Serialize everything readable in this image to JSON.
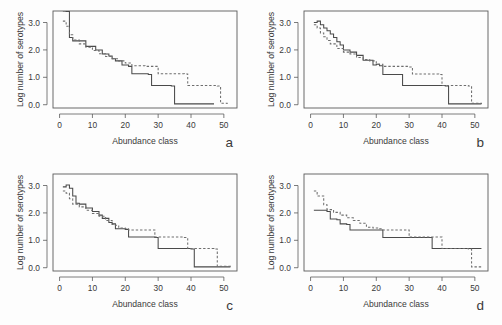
{
  "figure": {
    "title": "",
    "panel_letters": [
      "a",
      "b",
      "c",
      "d"
    ],
    "colors": {
      "solid_line": "#4a4a4a",
      "dashed_line": "#6e6e6e",
      "axis": "#5a5a5a",
      "background": "#fdfdfd",
      "text": "#3a3a3a"
    }
  },
  "chart_data": [
    {
      "type": "line",
      "panel": "a",
      "title": "",
      "xlabel": "Abundance class",
      "ylabel": "Log number of serotypes",
      "xlim": [
        -2,
        54
      ],
      "ylim": [
        -0.12,
        3.42
      ],
      "xticks": [
        0,
        10,
        20,
        30,
        40,
        50
      ],
      "xticklabels": [
        "0",
        "10",
        "20",
        "30",
        "40",
        "50"
      ],
      "yticks": [
        0.0,
        1.0,
        2.0,
        3.0
      ],
      "yticklabels": [
        "0.0",
        "1.0",
        "2.0",
        "3.0"
      ],
      "grid": false,
      "legend": "none",
      "drawstyle": "steps-post",
      "series": [
        {
          "name": "observed",
          "style": "solid",
          "x": [
            1,
            2,
            3,
            4,
            7,
            8,
            11,
            13,
            15,
            16,
            17,
            19,
            21,
            22,
            27,
            28,
            34,
            35,
            47
          ],
          "y": [
            3.42,
            3.4,
            2.45,
            2.33,
            2.33,
            2.13,
            2.0,
            1.85,
            1.78,
            1.68,
            1.6,
            1.45,
            1.4,
            1.13,
            1.1,
            0.7,
            0.68,
            0.03,
            0.03
          ]
        },
        {
          "name": "expected",
          "style": "dashed",
          "x": [
            1,
            2,
            3,
            4,
            6,
            8,
            10,
            12,
            14,
            16,
            18,
            20,
            22,
            26,
            29,
            30,
            38,
            39,
            48,
            49,
            51
          ],
          "y": [
            3.05,
            2.86,
            2.55,
            2.36,
            2.22,
            2.1,
            1.98,
            1.86,
            1.76,
            1.68,
            1.6,
            1.52,
            1.42,
            1.4,
            1.4,
            1.13,
            1.12,
            0.7,
            0.68,
            0.05,
            0.03
          ]
        }
      ]
    },
    {
      "type": "line",
      "panel": "b",
      "title": "",
      "xlabel": "Abundance class",
      "ylabel": "Log number of serotypes",
      "xlim": [
        -2,
        54
      ],
      "ylim": [
        -0.12,
        3.42
      ],
      "xticks": [
        0,
        10,
        20,
        30,
        40,
        50
      ],
      "xticklabels": [
        "0",
        "10",
        "20",
        "30",
        "40",
        "50"
      ],
      "yticks": [
        0.0,
        1.0,
        2.0,
        3.0
      ],
      "yticklabels": [
        "0.0",
        "1.0",
        "2.0",
        "3.0"
      ],
      "grid": false,
      "legend": "none",
      "drawstyle": "steps-post",
      "series": [
        {
          "name": "observed",
          "style": "solid",
          "x": [
            1,
            2,
            3,
            4,
            5,
            6,
            7,
            8,
            9,
            10,
            12,
            14,
            16,
            18,
            19,
            20,
            21,
            22,
            27,
            28,
            41,
            42,
            52
          ],
          "y": [
            3.0,
            3.05,
            2.92,
            2.8,
            2.7,
            2.58,
            2.45,
            2.3,
            2.18,
            2.0,
            1.92,
            1.8,
            1.62,
            1.62,
            1.45,
            1.48,
            1.42,
            1.1,
            1.1,
            0.7,
            0.68,
            0.03,
            0.03
          ]
        },
        {
          "name": "expected",
          "style": "dashed",
          "x": [
            1,
            2,
            3,
            4,
            5,
            6,
            8,
            10,
            12,
            14,
            16,
            18,
            20,
            22,
            24,
            28,
            30,
            31,
            39,
            40,
            48,
            49,
            52
          ],
          "y": [
            2.92,
            2.8,
            2.62,
            2.48,
            2.34,
            2.22,
            2.05,
            1.92,
            1.85,
            1.72,
            1.65,
            1.6,
            1.48,
            1.4,
            1.4,
            1.4,
            1.38,
            1.12,
            1.1,
            0.7,
            0.68,
            0.05,
            0.03
          ]
        }
      ]
    },
    {
      "type": "line",
      "panel": "c",
      "title": "",
      "xlabel": "Abundance class",
      "ylabel": "Log number of serotypes",
      "xlim": [
        -2,
        54
      ],
      "ylim": [
        -0.12,
        3.42
      ],
      "xticks": [
        0,
        10,
        20,
        30,
        40,
        50
      ],
      "xticklabels": [
        "0",
        "10",
        "20",
        "30",
        "40",
        "50"
      ],
      "yticks": [
        0.0,
        1.0,
        2.0,
        3.0
      ],
      "yticklabels": [
        "0.0",
        "1.0",
        "2.0",
        "3.0"
      ],
      "grid": false,
      "legend": "none",
      "drawstyle": "steps-post",
      "series": [
        {
          "name": "observed",
          "style": "solid",
          "x": [
            1,
            2,
            3,
            4,
            5,
            6,
            8,
            10,
            12,
            13,
            15,
            16,
            17,
            20,
            21,
            29,
            30,
            40,
            41,
            52
          ],
          "y": [
            2.95,
            3.02,
            2.9,
            2.62,
            2.35,
            2.32,
            2.18,
            2.05,
            1.92,
            1.8,
            1.65,
            1.6,
            1.42,
            1.4,
            1.12,
            1.1,
            0.7,
            0.68,
            0.03,
            0.03
          ]
        },
        {
          "name": "expected",
          "style": "dashed",
          "x": [
            1,
            2,
            3,
            4,
            6,
            8,
            10,
            12,
            14,
            16,
            17,
            18,
            20,
            21,
            28,
            29,
            38,
            39,
            47,
            48,
            52
          ],
          "y": [
            2.8,
            2.72,
            2.52,
            2.32,
            2.22,
            2.1,
            1.98,
            1.88,
            1.72,
            1.58,
            1.55,
            1.45,
            1.42,
            1.38,
            1.38,
            1.12,
            1.1,
            0.7,
            0.68,
            0.05,
            0.03
          ]
        }
      ]
    },
    {
      "type": "line",
      "panel": "d",
      "title": "",
      "xlabel": "Abundance class",
      "ylabel": "Log number of serotypes",
      "xlim": [
        -2,
        54
      ],
      "ylim": [
        -0.12,
        3.42
      ],
      "xticks": [
        0,
        10,
        20,
        30,
        40,
        50
      ],
      "xticklabels": [
        "0",
        "10",
        "20",
        "30",
        "40",
        "50"
      ],
      "yticks": [
        0.0,
        1.0,
        2.0,
        3.0
      ],
      "yticklabels": [
        "0.0",
        "1.0",
        "2.0",
        "3.0"
      ],
      "grid": false,
      "legend": "none",
      "drawstyle": "steps-post",
      "series": [
        {
          "name": "observed",
          "style": "solid",
          "x": [
            1,
            2,
            5,
            6,
            8,
            9,
            11,
            12,
            21,
            22,
            36,
            37,
            52
          ],
          "y": [
            2.1,
            2.1,
            2.05,
            1.78,
            1.75,
            1.6,
            1.58,
            1.38,
            1.38,
            1.1,
            1.1,
            0.7,
            0.7
          ]
        },
        {
          "name": "expected",
          "style": "dashed",
          "x": [
            1,
            2,
            4,
            5,
            7,
            9,
            11,
            13,
            15,
            17,
            19,
            21,
            22,
            24,
            29,
            30,
            38,
            39,
            40,
            48,
            49,
            52
          ],
          "y": [
            2.8,
            2.62,
            2.3,
            2.12,
            2.02,
            1.92,
            1.82,
            1.72,
            1.62,
            1.48,
            1.45,
            1.42,
            1.38,
            1.38,
            1.38,
            1.12,
            1.12,
            1.12,
            0.7,
            0.68,
            0.03,
            0.03
          ]
        }
      ]
    }
  ]
}
